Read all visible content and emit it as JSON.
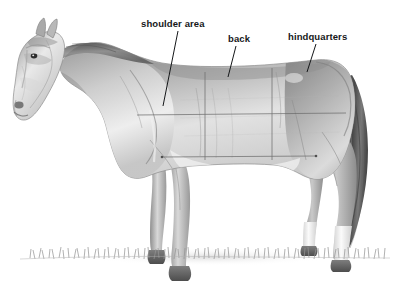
{
  "figure": {
    "type": "anatomical-illustration",
    "view": "left side profile, facing left",
    "medium": "graphite pencil drawing",
    "background_color": "#ffffff",
    "ink_color": "#16181a",
    "guide_line_color": "#6b6b6b",
    "coat_colors": {
      "body": "#b9b9b9",
      "body_highlight": "#f2f2f2",
      "body_shadow": "#7e7e7e",
      "mane_tail": "#4f4f4f",
      "hooves": "#5a5a5a",
      "socks": "#fbfbfb",
      "grass": "#9a9a9a"
    }
  },
  "labels": [
    {
      "id": "shoulder-area",
      "text": "shoulder area",
      "x": 141,
      "y": 18,
      "leader": {
        "x1": 178,
        "y1": 31,
        "x2": 163,
        "y2": 106
      }
    },
    {
      "id": "back",
      "text": "back",
      "x": 228,
      "y": 33,
      "leader": {
        "x1": 236,
        "y1": 46,
        "x2": 228,
        "y2": 77
      }
    },
    {
      "id": "hindquarters",
      "text": "hindquarters",
      "x": 288,
      "y": 31,
      "leader": {
        "x1": 316,
        "y1": 44,
        "x2": 307,
        "y2": 72
      }
    }
  ],
  "guide_lines": [
    {
      "id": "upper-horizontal",
      "orientation": "horizontal",
      "x1": 137,
      "y1": 115,
      "x2": 346,
      "y2": 113
    },
    {
      "id": "lower-horizontal",
      "orientation": "horizontal",
      "x1": 162,
      "y1": 157,
      "x2": 316,
      "y2": 156
    },
    {
      "id": "shoulder-back-divider",
      "orientation": "vertical",
      "x1": 205,
      "y1": 72,
      "x2": 205,
      "y2": 160
    },
    {
      "id": "back-hindquarters-divider",
      "orientation": "vertical",
      "x1": 272,
      "y1": 68,
      "x2": 272,
      "y2": 160
    }
  ],
  "regions": [
    {
      "id": "shoulder-area",
      "name": "shoulder area"
    },
    {
      "id": "back",
      "name": "back"
    },
    {
      "id": "hindquarters",
      "name": "hindquarters"
    }
  ]
}
